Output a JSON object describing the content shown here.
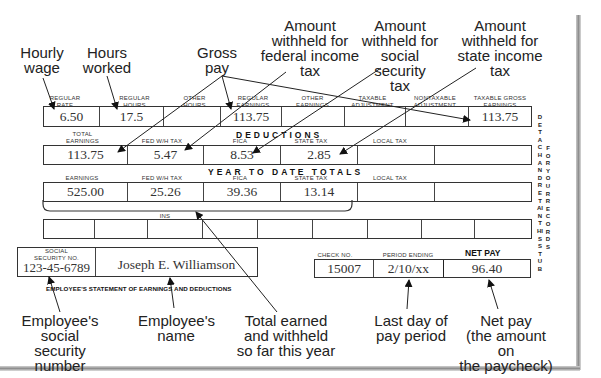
{
  "figure": {
    "type": "Employee pay stub (statement of earnings and deductions) with explanatory callouts"
  },
  "callouts": {
    "hourly_wage": "Hourly\nwage",
    "hours_worked": "Hours\nworked",
    "gross_pay": "Gross\npay",
    "federal_tax": "Amount\nwithheld for\nfederal income\ntax",
    "social_security_tax": "Amount\nwithheld for\nsocial security\ntax",
    "state_tax": "Amount\nwithheld for\nstate income\ntax",
    "ssn": "Employee's\nsocial security\nnumber",
    "name": "Employee's\nname",
    "ytd": "Total earned\nand withheld\nso far this year",
    "period_end": "Last day of\npay period",
    "net_pay": "Net pay\n(the amount on\nthe paycheck)"
  },
  "earnings": {
    "headers": [
      "REGULAR\nRATE",
      "REGULAR\nHOURS",
      "OTHER\nHOURS",
      "REGULAR\nEARNINGS",
      "OTHER\nEARNINGS",
      "TAXABLE\nADJUSTMENT",
      "NONTAXABLE\nADJUSTMENT",
      "TAXABLE GROSS\nEARNINGS"
    ],
    "values": [
      "6.50",
      "17.5",
      "",
      "113.75",
      "",
      "",
      "",
      "113.75"
    ]
  },
  "deductions": {
    "title": "DEDUCTIONS",
    "headers": [
      "TOTAL\nEARNINGS",
      "FED W/H TAX",
      "FICA",
      "STATE TAX",
      "LOCAL TAX",
      ""
    ],
    "values": [
      "113.75",
      "5.47",
      "8.53",
      "2.85",
      "",
      ""
    ]
  },
  "ytd": {
    "title": "YEAR TO DATE TOTALS",
    "headers": [
      "EARNINGS",
      "FED W/H TAX",
      "FICA",
      "STATE TAX",
      "LOCAL TAX",
      ""
    ],
    "values": [
      "525.00",
      "25.26",
      "39.36",
      "13.14",
      "",
      ""
    ]
  },
  "ins": {
    "label": "INS",
    "values": [
      "",
      "",
      "",
      "",
      "",
      "",
      "",
      "",
      "",
      "",
      ""
    ]
  },
  "employee": {
    "ssn_label": "SOCIAL\nSECURITY NO.",
    "ssn": "123-45-6789",
    "name": "Joseph E. Williamson",
    "statement_title": "EMPLOYEE'S STATEMENT OF EARNINGS AND DEDUCTIONS"
  },
  "check": {
    "check_no_label": "CHECK NO.",
    "check_no": "15007",
    "period_label": "PERIOD ENDING",
    "period": "2/10/xx",
    "net_pay_label": "NET PAY",
    "net_pay": "96.40"
  },
  "side_text": {
    "col1": "DETACH AND RETAIN THIS STUB",
    "col2": "FOR YOUR RECORDS"
  },
  "colors": {
    "ink": "#222222",
    "paper": "#ffffff",
    "edge_shadow": "#8f8f8f"
  }
}
